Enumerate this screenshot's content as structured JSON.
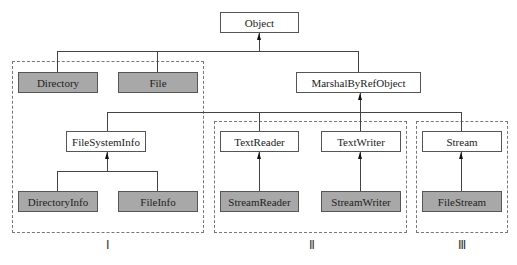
{
  "diagram": {
    "type": "class-hierarchy",
    "root": {
      "label": "Object"
    },
    "nodes": {
      "object": {
        "label": "Object",
        "shaded": false
      },
      "directory": {
        "label": "Directory",
        "shaded": true
      },
      "file": {
        "label": "File",
        "shaded": true
      },
      "marshal": {
        "label": "MarshalByRefObject",
        "shaded": false
      },
      "filesysteminfo": {
        "label": "FileSystemInfo",
        "shaded": false
      },
      "directoryinfo": {
        "label": "DirectoryInfo",
        "shaded": true
      },
      "fileinfo": {
        "label": "FileInfo",
        "shaded": true
      },
      "textreader": {
        "label": "TextReader",
        "shaded": false
      },
      "textwriter": {
        "label": "TextWriter",
        "shaded": false
      },
      "streamreader": {
        "label": "StreamReader",
        "shaded": true
      },
      "streamwriter": {
        "label": "StreamWriter",
        "shaded": true
      },
      "stream": {
        "label": "Stream",
        "shaded": false
      },
      "filestream": {
        "label": "FileStream",
        "shaded": true
      }
    },
    "edges": [
      {
        "from": "directory",
        "to": "object"
      },
      {
        "from": "file",
        "to": "object"
      },
      {
        "from": "marshal",
        "to": "object"
      },
      {
        "from": "filesysteminfo",
        "to": "marshal"
      },
      {
        "from": "textreader",
        "to": "marshal"
      },
      {
        "from": "textwriter",
        "to": "marshal"
      },
      {
        "from": "stream",
        "to": "marshal"
      },
      {
        "from": "directoryinfo",
        "to": "filesysteminfo"
      },
      {
        "from": "fileinfo",
        "to": "filesysteminfo"
      },
      {
        "from": "streamreader",
        "to": "textreader"
      },
      {
        "from": "streamwriter",
        "to": "textwriter"
      },
      {
        "from": "filestream",
        "to": "stream"
      }
    ],
    "groups": [
      {
        "label": "Ⅰ",
        "members": [
          "directory",
          "file",
          "filesysteminfo",
          "directoryinfo",
          "fileinfo"
        ]
      },
      {
        "label": "Ⅱ",
        "members": [
          "textreader",
          "textwriter",
          "streamreader",
          "streamwriter"
        ]
      },
      {
        "label": "Ⅲ",
        "members": [
          "stream",
          "filestream"
        ]
      }
    ],
    "colors": {
      "shaded_fill": "#a8a8a8",
      "border": "#555555",
      "dashed": "#777777"
    }
  }
}
